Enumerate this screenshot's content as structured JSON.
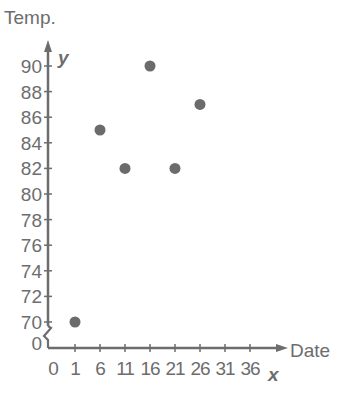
{
  "chart_data": {
    "type": "scatter",
    "title": "",
    "xlabel": "Date",
    "ylabel": "Temp.",
    "x_axis_letter": "x",
    "y_axis_letter": "y",
    "x_ticks": [
      0,
      1,
      6,
      11,
      16,
      21,
      26,
      31,
      36
    ],
    "y_ticks": [
      0,
      70,
      72,
      74,
      76,
      78,
      80,
      82,
      84,
      86,
      88,
      90
    ],
    "y_axis_break": true,
    "xlim": [
      0,
      38
    ],
    "ylim": [
      68,
      92
    ],
    "grid": false,
    "legend": null,
    "points": [
      {
        "x": 1,
        "y": 70
      },
      {
        "x": 6,
        "y": 85
      },
      {
        "x": 11,
        "y": 82
      },
      {
        "x": 16,
        "y": 90
      },
      {
        "x": 21,
        "y": 82
      },
      {
        "x": 26,
        "y": 87
      }
    ],
    "colors": {
      "axis": "#6d6d6d",
      "point": "#6b6b6b",
      "text": "#6d6d6d"
    }
  }
}
